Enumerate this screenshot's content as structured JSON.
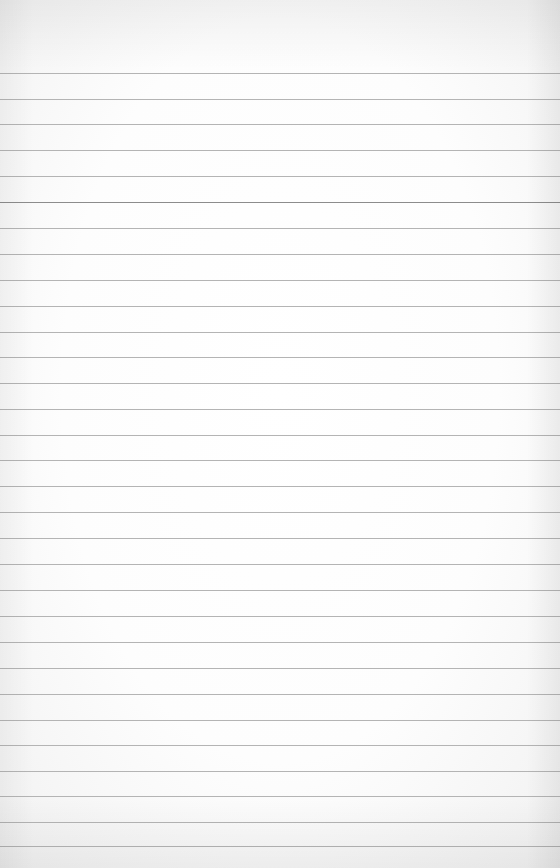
{
  "image": {
    "description": "Blank lined notebook paper",
    "background_color": "#fdfdfd",
    "line_color": "#b4b4b4",
    "line_count": 31,
    "line_y_positions": [
      73,
      99,
      124,
      150,
      176,
      202,
      228,
      254,
      280,
      306,
      332,
      357,
      383,
      409,
      435,
      460,
      486,
      512,
      538,
      564,
      590,
      616,
      642,
      668,
      694,
      720,
      745,
      771,
      796,
      822,
      846
    ]
  }
}
